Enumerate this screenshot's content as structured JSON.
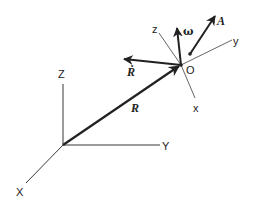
{
  "diagram": {
    "type": "coordinate-frames",
    "colors": {
      "line": "#222222",
      "background": "#ffffff"
    },
    "inertial_frame": {
      "origin": [
        63,
        145
      ],
      "axes": [
        {
          "name": "Z",
          "label": "Z"
        },
        {
          "name": "Y",
          "label": "Y"
        },
        {
          "name": "X",
          "label": "X"
        }
      ]
    },
    "moving_frame": {
      "origin_label": "O",
      "axes": [
        {
          "name": "z",
          "label": "z"
        },
        {
          "name": "y",
          "label": "y"
        },
        {
          "name": "x",
          "label": "x"
        }
      ]
    },
    "vectors": {
      "position": {
        "label": "R"
      },
      "velocity": {
        "label": "Ṙ"
      },
      "angular_velocity": {
        "label": "ω"
      },
      "vector_a": {
        "label": "A"
      }
    }
  }
}
